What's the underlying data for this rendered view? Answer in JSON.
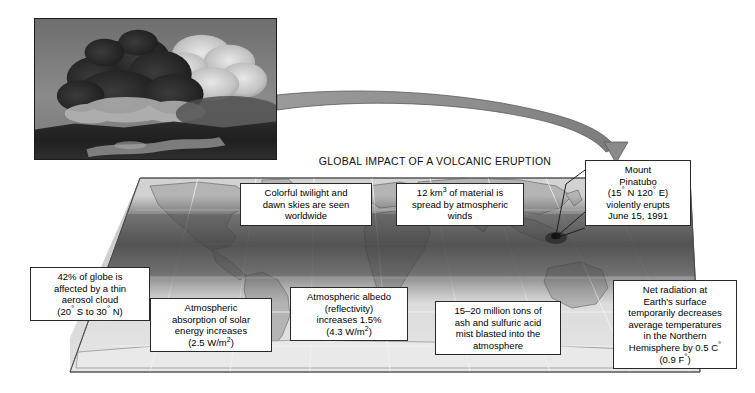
{
  "figure": {
    "title": "GLOBAL IMPACT OF A VOLCANIC ERUPTION",
    "photo_caption": "volcanic-eruption-ash-column-photograph"
  },
  "callouts": {
    "pinatubo": {
      "line1": "Mount",
      "line2": "Pinatubo",
      "line3_a": "(15",
      "line3_deg1": "°",
      "line3_b": " N 120",
      "line3_deg2": "°",
      "line3_c": " E)",
      "line4": "violently erupts",
      "line5": "June 15, 1991"
    },
    "twilight": {
      "line1": "Colorful twilight and",
      "line2": "dawn skies are seen",
      "line3": "worldwide"
    },
    "material": {
      "line1_a": "12 km",
      "line1_sup": "3",
      "line1_b": " of material is",
      "line2": "spread by atmospheric",
      "line3": "winds"
    },
    "aerosol": {
      "line1": "42% of globe is",
      "line2": "affected by a thin",
      "line3": "aerosol cloud",
      "line4_a": "(20",
      "line4_deg1": "°",
      "line4_b": " S to 30",
      "line4_deg2": "°",
      "line4_c": " N)"
    },
    "absorption": {
      "line1": "Atmospheric",
      "line2": "absorption of solar",
      "line3": "energy increases",
      "line4_a": "(2.5 W/m",
      "line4_sup": "2",
      "line4_b": ")"
    },
    "albedo": {
      "line1": "Atmospheric albedo",
      "line2": "(reflectivity)",
      "line3": "increases 1.5%",
      "line4_a": "(4.3 W/m",
      "line4_sup": "2",
      "line4_b": ")"
    },
    "ash": {
      "line1": "15–20 million tons of",
      "line2": "ash and sulfuric acid",
      "line3": "mist blasted into the",
      "line4": "atmosphere"
    },
    "netrad": {
      "line1": "Net radiation at",
      "line2": "Earth's surface",
      "line3": "temporarily decreases",
      "line4": "average temperatures",
      "line5": "in the Northern",
      "line6_a": "Hemisphere by 0.5 C",
      "line6_deg": "°",
      "line7_a": "(0.9 F",
      "line7_deg": "°",
      "line7_b": ")"
    }
  },
  "map": {
    "eruption_marker": "mount-pinatubo-eruption-site",
    "aerosol_band_label": "tropical-aerosol-cloud-band"
  },
  "colors": {
    "map_land": "#b9b9b9",
    "map_ocean": "#dcdcdc",
    "aerosol_band": "#4a4a4a",
    "slab_edge": "#333333",
    "arrow": "#8a8a8a",
    "box_border": "#2a2a2a",
    "text": "#000000"
  }
}
